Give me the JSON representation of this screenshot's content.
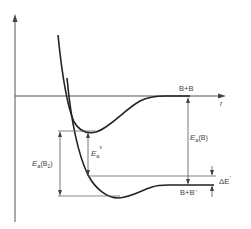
{
  "diagram": {
    "type": "potential-energy-curves",
    "axes": {
      "x_label": "r",
      "y_label": ""
    },
    "curves": [
      {
        "name": "B2",
        "description": "neutral molecule potential curve",
        "asymptote_label": "B+B"
      },
      {
        "name": "B2-",
        "description": "anion potential curve",
        "asymptote_label": "B+B⁻"
      }
    ],
    "labels": {
      "asymptote_neutral": "B+B",
      "asymptote_anion": "B+B⁻",
      "r_axis": "r",
      "ea_atom_E": "E",
      "ea_atom_sub": "a",
      "ea_atom_paren": "(B)",
      "ea_molecule_E": "E",
      "ea_molecule_sub": "a",
      "ea_molecule_paren": "(B",
      "ea_molecule_paren_sub": "2",
      "ea_molecule_close": ")",
      "ea_vertical_E": "E",
      "ea_vertical_sub": "a",
      "ea_vertical_sup": "v",
      "delta_E": "ΔE",
      "delta_E_prime": "′"
    },
    "colors": {
      "curve": "#222222",
      "axis": "#555555",
      "guide": "#666666",
      "text": "#444444",
      "background": "#ffffff"
    }
  }
}
